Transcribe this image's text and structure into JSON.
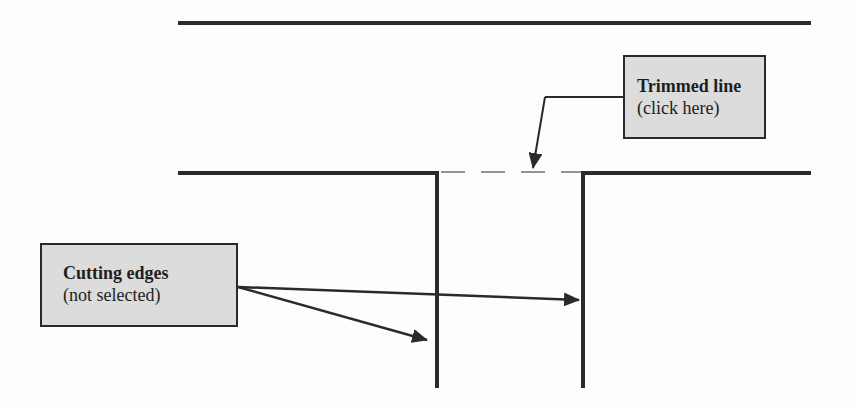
{
  "diagram": {
    "type": "trim-operation-illustration",
    "colors": {
      "background": "#fdfdfd",
      "line": "#2a2a2a",
      "callout_fill": "#dcdcdc",
      "callout_border": "#2a2a2a",
      "text": "#1e1e1e"
    },
    "callouts": {
      "trimmed_line": {
        "title": "Trimmed line",
        "subtitle": "(click here)"
      },
      "cutting_edges": {
        "title": "Cutting edges",
        "subtitle": "(not selected)"
      }
    },
    "elements": {
      "top_line": "solid horizontal line",
      "left_segment": "horizontal line with vertical drop (cutting edge 1)",
      "right_segment": "horizontal line with vertical drop (cutting edge 2)",
      "trimmed_segment": "dashed horizontal line between cutting edges"
    }
  }
}
